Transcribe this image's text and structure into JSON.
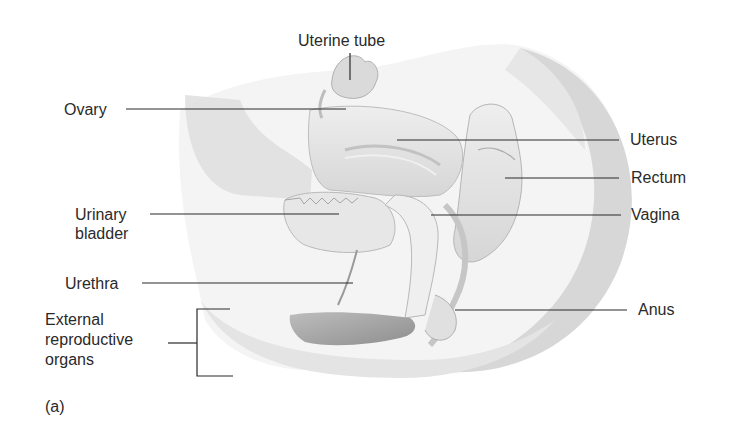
{
  "figure": {
    "panel_label": "(a)",
    "labels": {
      "uterine_tube": "Uterine tube",
      "ovary": "Ovary",
      "uterus": "Uterus",
      "rectum": "Rectum",
      "vagina": "Vagina",
      "urinary_bladder": "Urinary\nbladder",
      "urethra": "Urethra",
      "anus": "Anus",
      "external_reproductive_organs": "External\nreproductive\norgans"
    },
    "colors": {
      "background": "#ffffff",
      "leader_line": "#2a2a2a",
      "tissue_light": "#ececec",
      "tissue_mid": "#d4d4d4",
      "tissue_dark": "#a9a9a9"
    }
  }
}
